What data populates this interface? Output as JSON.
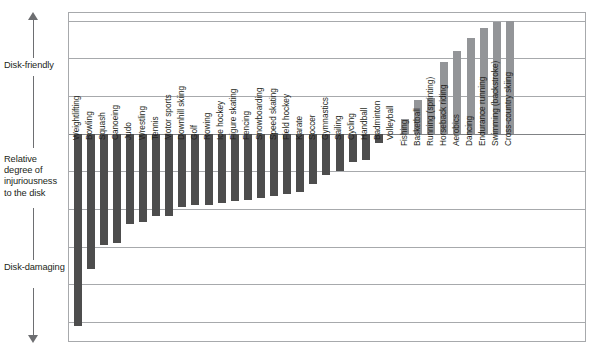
{
  "axis": {
    "top_label": "Disk-friendly",
    "middle_label": "Relative degree of injuriousness to the disk",
    "bottom_label": "Disk-damaging",
    "up_arrow_icon": "arrow-up-icon",
    "down_arrow_icon": "arrow-down-icon"
  },
  "colors": {
    "negative_bar": "#4d4d4d",
    "positive_bar": "#939598",
    "gridline": "#a7a9ac",
    "frame": "#a7a9ac",
    "text": "#231f20",
    "arrow": "#6d6e71"
  },
  "chart_data": {
    "type": "bar",
    "title": "",
    "subtitle": "",
    "xlabel": "",
    "ylabel": "Relative degree of injuriousness to the disk",
    "ylim": [
      -5.5,
      3.2
    ],
    "grid": true,
    "gridlines_every": 1,
    "legend": "none",
    "orientation": "vertical",
    "baseline": 0,
    "annotations": [
      "Disk-friendly",
      "Disk-damaging"
    ],
    "categories": [
      "Weightlifting",
      "Bowling",
      "Squash",
      "Canoeing",
      "Judo",
      "Wrestling",
      "Tennis",
      "Motor sports",
      "Downhill skiing",
      "Golf",
      "Rowing",
      "Ice hockey",
      "Figure skating",
      "Fencing",
      "Snowboarding",
      "Speed skating",
      "Field hockey",
      "Karate",
      "Soccer",
      "Gymnastics",
      "Sailing",
      "Cycling",
      "Handball",
      "Badminton",
      "Volleyball",
      "Fishing",
      "Basketball",
      "Running (sprinting)",
      "Horseback riding",
      "Aerobics",
      "Dancing",
      "Endurance running",
      "Swimming (backstroke)",
      "Cross-country skiing"
    ],
    "values": [
      -5.1,
      -3.6,
      -2.95,
      -2.9,
      -2.4,
      -2.35,
      -2.2,
      -2.2,
      -1.95,
      -1.9,
      -1.9,
      -1.85,
      -1.8,
      -1.75,
      -1.7,
      -1.65,
      -1.6,
      -1.55,
      -1.35,
      -1.1,
      -1.0,
      -0.75,
      -0.7,
      -0.25,
      0.0,
      0.4,
      0.9,
      0.95,
      1.9,
      2.2,
      2.55,
      2.8,
      2.95,
      3.0
    ]
  }
}
